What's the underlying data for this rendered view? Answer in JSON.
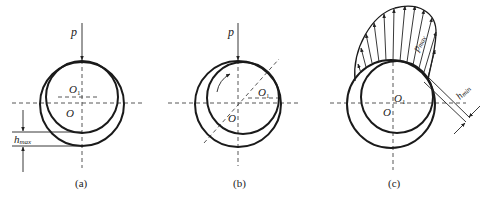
{
  "figure": {
    "panels": [
      {
        "id": "a",
        "caption": "(a)",
        "load_label": "p",
        "bearing_center_label": "O",
        "journal_center_label": "O",
        "journal_center_subscript": "1",
        "gap_label": "h",
        "gap_subscript": "max"
      },
      {
        "id": "b",
        "caption": "(b)",
        "load_label": "p",
        "bearing_center_label": "O",
        "journal_center_label": "O",
        "journal_center_subscript": "1"
      },
      {
        "id": "c",
        "caption": "(c)",
        "bearing_center_label": "O",
        "journal_center_label": "O",
        "journal_center_subscript": "1",
        "pressure_label": "p",
        "pressure_subscript": "max",
        "gap_label": "h",
        "gap_subscript": "min"
      }
    ]
  }
}
